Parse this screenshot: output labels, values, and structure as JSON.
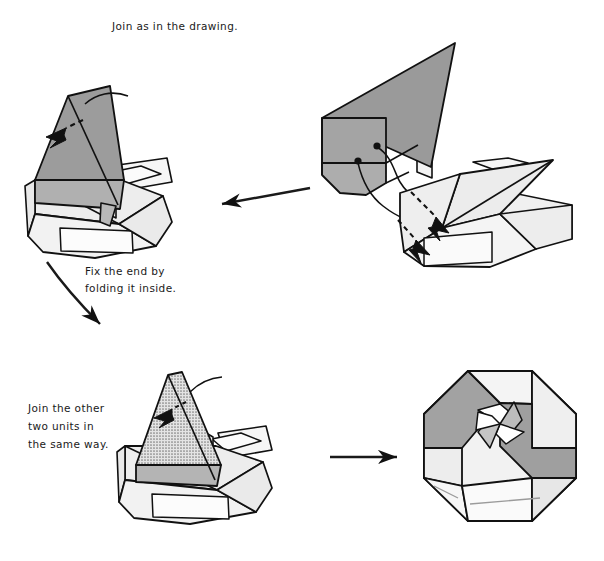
{
  "page": {
    "width": 604,
    "height": 561,
    "background": "#ffffff",
    "kind": "origami-assembly-diagram"
  },
  "palette": {
    "ink": "#1a1a1a",
    "outline": "#111111",
    "gray_dark": "#9a9a9a",
    "gray_mid": "#b4b4b4",
    "gray_light": "#e9e9e9",
    "gray_lighter": "#f3f3f3",
    "white": "#ffffff"
  },
  "captions": [
    {
      "id": "caption-join-drawing",
      "name": "caption-join-as-in-the-drawing",
      "lines": [
        "Join as in the drawing."
      ],
      "x": 112,
      "y": 30,
      "anchor": "start"
    },
    {
      "id": "caption-fix-end",
      "name": "caption-fix-the-end",
      "lines": [
        "Fix the end by",
        "folding it inside."
      ],
      "x": 85,
      "y": 275,
      "anchor": "start"
    },
    {
      "id": "caption-join-other-two",
      "name": "caption-join-other-two-units",
      "lines": [
        "Join the other",
        "two units in",
        "the same way."
      ],
      "x": 28,
      "y": 412,
      "anchor": "start"
    }
  ],
  "panels": [
    {
      "id": "panel-top-right",
      "name": "panel-two-units-before-joining",
      "label": "Two separate units shown before joining",
      "position": {
        "x": 325,
        "y": 40,
        "width": 255,
        "height": 225
      }
    },
    {
      "id": "panel-top-left",
      "name": "panel-units-joined",
      "label": "Units joined, flap inserted into pocket",
      "position": {
        "x": 20,
        "y": 85,
        "width": 185,
        "height": 175
      }
    },
    {
      "id": "panel-bottom-left",
      "name": "panel-repeat-with-remaining-units",
      "label": "Repeat the join with the other two units",
      "position": {
        "x": 110,
        "y": 365,
        "width": 185,
        "height": 165
      }
    },
    {
      "id": "panel-bottom-right",
      "name": "panel-completed-hexagonal-box",
      "label": "Completed hexagonal pinwheel box",
      "position": {
        "x": 405,
        "y": 365,
        "width": 180,
        "height": 175
      }
    }
  ],
  "arrows": [
    {
      "id": "arrow-right-to-left",
      "name": "flow-arrow-leftward",
      "direction": "left",
      "from": [
        310,
        188
      ],
      "to": [
        215,
        205
      ]
    },
    {
      "id": "arrow-down-curve",
      "name": "flow-arrow-down-curved",
      "direction": "down",
      "from": [
        48,
        262
      ],
      "to": [
        105,
        332
      ]
    },
    {
      "id": "arrow-left-to-right",
      "name": "flow-arrow-rightward",
      "direction": "right",
      "from": [
        330,
        457
      ],
      "to": [
        400,
        457
      ]
    }
  ],
  "markers": {
    "join_dots": [
      {
        "name": "join-dot-upper",
        "x": 377,
        "y": 145
      },
      {
        "name": "join-dot-lower",
        "x": 358,
        "y": 160
      }
    ],
    "insert_arrows": [
      {
        "name": "insert-arrow-upper",
        "label": "tuck flap into pocket"
      },
      {
        "name": "insert-arrow-lower",
        "label": "tuck flap into pocket"
      }
    ],
    "fold_arrows": [
      {
        "name": "fold-over-arrow-top-left",
        "label": "fold flap down"
      },
      {
        "name": "fold-over-arrow-bottom-left",
        "label": "fold flap down"
      }
    ]
  }
}
